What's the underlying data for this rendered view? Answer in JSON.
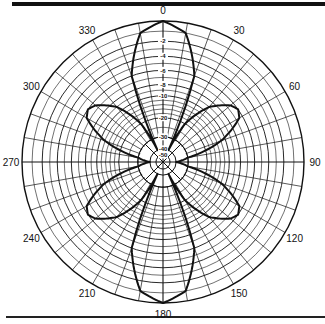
{
  "chart_data": {
    "type": "polar",
    "title": "",
    "angular_unit": "degrees",
    "angular_direction": "clockwise",
    "zero_location": "top",
    "angle_tick_labels": [
      "0",
      "30",
      "60",
      "90",
      "120",
      "150",
      "180",
      "210",
      "240",
      "270",
      "300",
      "330"
    ],
    "angle_ticks": [
      0,
      30,
      60,
      90,
      120,
      150,
      180,
      210,
      240,
      270,
      300,
      330
    ],
    "radial_unit": "dB",
    "radial_tick_labels": [
      "-2",
      "-4",
      "-6",
      "-8",
      "-10",
      "-20",
      "-30",
      "-40",
      "-50"
    ],
    "radial_ticks_db": [
      0,
      -2,
      -4,
      -6,
      -8,
      -10,
      -20,
      -30,
      -40,
      -50
    ],
    "radial_pixel_fraction": [
      1.0,
      0.857,
      0.75,
      0.65,
      0.55,
      0.47,
      0.314,
      0.179,
      0.093,
      0.05
    ],
    "grid": {
      "spoke_step_deg": 10,
      "minor_rings": true
    },
    "series": [
      {
        "name": "radiation pattern",
        "angles_deg": [
          0,
          10,
          20,
          25,
          30,
          40,
          50,
          55,
          60,
          70,
          80,
          90,
          100,
          110,
          120,
          125,
          130,
          140,
          150,
          155,
          160,
          170,
          180
        ],
        "gain_db": [
          0,
          -1,
          -6,
          -40,
          -20,
          -9,
          -6.5,
          -6,
          -6.5,
          -12,
          -30,
          -40,
          -30,
          -12,
          -6.5,
          -6,
          -6.5,
          -9,
          -20,
          -40,
          -6,
          -1,
          0
        ]
      }
    ],
    "symmetry": "mirror about 0-180 axis",
    "lobes": [
      {
        "direction_deg": 0,
        "peak_db": 0
      },
      {
        "direction_deg": 55,
        "peak_db": -6
      },
      {
        "direction_deg": 125,
        "peak_db": -6
      },
      {
        "direction_deg": 180,
        "peak_db": 0
      },
      {
        "direction_deg": 235,
        "peak_db": -6
      },
      {
        "direction_deg": 305,
        "peak_db": -6
      }
    ]
  },
  "colors": {
    "ink": "#111111",
    "background": "#ffffff"
  }
}
